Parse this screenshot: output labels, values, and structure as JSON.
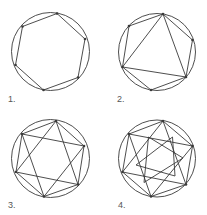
{
  "figures": [
    {
      "label": "1.",
      "description": "hexagon inscribed in circle"
    },
    {
      "label": "2.",
      "description": "hexagon with one inscribed triangle"
    },
    {
      "label": "3.",
      "description": "hexagon with hexagram (two triangles)"
    },
    {
      "label": "4.",
      "description": "hexagon with hexagram and inner hexagram"
    }
  ],
  "colors": {
    "stroke": "#3a3a3a",
    "background": "#ffffff",
    "label": "#555555"
  }
}
